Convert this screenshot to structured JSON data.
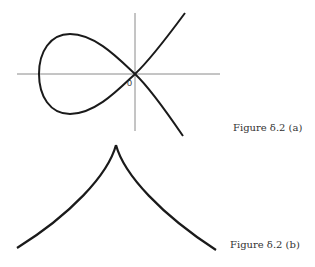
{
  "figure_a": {
    "caption": "Figure δ.2 (a)",
    "origin_label": "0",
    "description": "Nodal cubic curve (loop with self-intersection at origin) with x and y axes"
  },
  "figure_b": {
    "caption": "Figure δ.2 (b)",
    "description": "Cuspidal curve with cusp pointing upward"
  },
  "colors": {
    "curve": "#1a1a1a",
    "axis": "#888888",
    "text": "#333333"
  }
}
